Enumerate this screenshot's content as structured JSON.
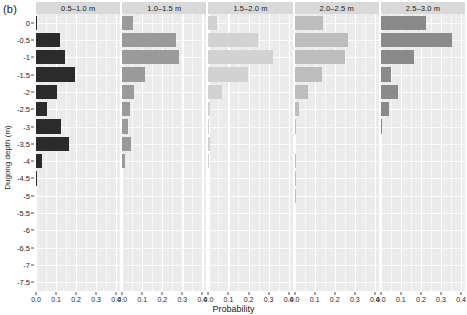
{
  "figure": {
    "panel_label": "(b)",
    "xlabel": "Probability",
    "ylabel": "Dugong depth (m)"
  },
  "axes": {
    "x_ticks": [
      "0.0",
      "0.1",
      "0.2",
      "0.3",
      "0.4"
    ],
    "x_tick_values": [
      0.0,
      0.1,
      0.2,
      0.3,
      0.4
    ],
    "y_ticks": [
      "0",
      "-0.5",
      "-1",
      "-1.5",
      "-2",
      "-2.5",
      "-3",
      "-3.5",
      "-4",
      "-4.5",
      "-5",
      "-5.5",
      "-6",
      "-6.5",
      "-7",
      "-7.5"
    ],
    "y_tick_values": [
      0,
      -0.5,
      -1,
      -1.5,
      -2,
      -2.5,
      -3,
      -3.5,
      -4,
      -4.5,
      -5,
      -5.5,
      -6,
      -6.5,
      -7,
      -7.5
    ]
  },
  "colors": {
    "panel_background": "#ebebeb",
    "strip_background": "#d9d9d9",
    "gridline": "#ffffff",
    "axis_text": "#262626",
    "bar_0_5_1_0": "#2b2b2b",
    "bar_1_0_1_5": "#9a9a9a",
    "bar_1_5_2_0": "#d2d2d2",
    "bar_2_0_2_5": "#bdbdbd",
    "bar_2_5_3_0": "#8a8a8a"
  },
  "chart_data": {
    "type": "bar",
    "title": "",
    "subtitle": "",
    "xlabel": "Probability",
    "ylabel": "Dugong depth (m)",
    "orientation": "horizontal",
    "xlim": [
      0.0,
      0.42
    ],
    "ylim": [
      -7.75,
      0.25
    ],
    "grid": true,
    "legend": "none",
    "facet_layout": "1 row x 5 columns",
    "categories": [
      0,
      -0.5,
      -1,
      -1.5,
      -2,
      -2.5,
      -3,
      -3.5,
      -4,
      -4.5,
      -5,
      -5.5,
      -6,
      -6.5,
      -7,
      -7.5
    ],
    "series": [
      {
        "name": "0.5–1.0 m",
        "color": "#2b2b2b",
        "values": [
          0.006,
          0.12,
          0.145,
          0.195,
          0.105,
          0.055,
          0.125,
          0.165,
          0.03,
          0.005,
          0,
          0,
          0,
          0,
          0,
          0
        ]
      },
      {
        "name": "1.0–1.5 m",
        "color": "#9a9a9a",
        "values": [
          0.055,
          0.27,
          0.285,
          0.115,
          0.06,
          0.04,
          0.028,
          0.042,
          0.012,
          0,
          0,
          0,
          0,
          0,
          0,
          0
        ]
      },
      {
        "name": "1.5–2.0 m",
        "color": "#d2d2d2",
        "values": [
          0.045,
          0.245,
          0.32,
          0.195,
          0.07,
          0.006,
          0.005,
          0.008,
          0.004,
          0,
          0,
          0,
          0,
          0,
          0,
          0
        ]
      },
      {
        "name": "2.0–2.5 m",
        "color": "#bdbdbd",
        "values": [
          0.14,
          0.265,
          0.25,
          0.135,
          0.065,
          0.02,
          0.005,
          0,
          0.006,
          0.005,
          0.006,
          0,
          0,
          0,
          0,
          0
        ]
      },
      {
        "name": "2.5–3.0 m",
        "color": "#8a8a8a",
        "values": [
          0.225,
          0.355,
          0.165,
          0.05,
          0.085,
          0.04,
          0.006,
          0,
          0,
          0,
          0,
          0,
          0,
          0,
          0,
          0
        ]
      }
    ]
  }
}
